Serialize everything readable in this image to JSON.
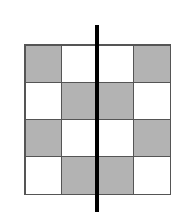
{
  "figure": {
    "type": "grid-symmetry-diagram",
    "rows": 4,
    "cols": 4,
    "colors": {
      "shaded": "#b3b3b3",
      "unshaded": "#ffffff",
      "gridline": "#555555",
      "axis": "#000000"
    },
    "cells": [
      [
        "shaded",
        "unshaded",
        "unshaded",
        "shaded"
      ],
      [
        "unshaded",
        "shaded",
        "shaded",
        "unshaded"
      ],
      [
        "shaded",
        "unshaded",
        "unshaded",
        "shaded"
      ],
      [
        "unshaded",
        "shaded",
        "shaded",
        "unshaded"
      ]
    ],
    "line_of_symmetry": {
      "orientation": "vertical",
      "position": "center"
    }
  }
}
